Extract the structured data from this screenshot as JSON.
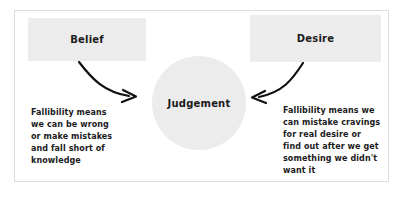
{
  "diagram": {
    "frame": {
      "border_color": "#dcdcdc",
      "background": "#ffffff"
    },
    "nodes": [
      {
        "id": "belief",
        "label": "Belief",
        "shape": "rectangle",
        "fill": "#ececec",
        "text_color": "#1b1b1b"
      },
      {
        "id": "desire",
        "label": "Desire",
        "shape": "rectangle",
        "fill": "#ececec",
        "text_color": "#1b1b1b"
      },
      {
        "id": "judgement",
        "label": "Judgement",
        "shape": "circle",
        "fill": "#ececec",
        "text_color": "#1b1b1b"
      }
    ],
    "edges": [
      {
        "id": "belief-to-judgement",
        "from": "belief",
        "to": "judgement",
        "style": "curved-arrow",
        "color": "#111111",
        "direction": "right"
      },
      {
        "id": "desire-to-judgement",
        "from": "desire",
        "to": "judgement",
        "style": "curved-arrow",
        "color": "#111111",
        "direction": "left"
      }
    ],
    "annotations": [
      {
        "id": "belief-fallibility-note",
        "attached_to": "belief",
        "text": "Fallibility means\nwe can be wrong\nor make mistakes\nand fall short of\nknowledge"
      },
      {
        "id": "desire-fallibility-note",
        "attached_to": "desire",
        "text": "Fallibility means we\ncan mistake cravings\nfor real desire or\nfind out after we get\nsomething we didn't\nwant it"
      }
    ]
  }
}
